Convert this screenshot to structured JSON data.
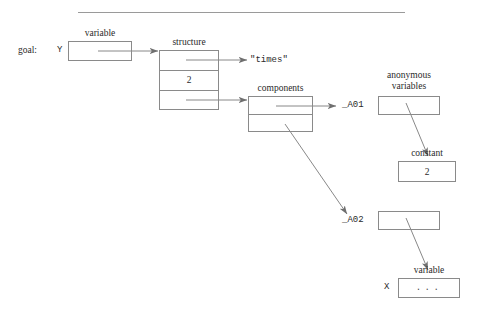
{
  "diagram": {
    "title_rule": "horizontal-rule",
    "goal_label": "goal:",
    "y_label": "Y",
    "x_label": "X",
    "captions": {
      "variable_y": "variable",
      "structure": "structure",
      "components": "components",
      "anonymous_variables_line1": "anonymous",
      "anonymous_variables_line2": "variables",
      "constant": "constant",
      "variable_x": "variable"
    },
    "values": {
      "functor": "\"times\"",
      "arity": "2",
      "constant_value": "2",
      "x_contents": "..."
    },
    "anon_refs": {
      "a01": "_A01",
      "a02": "_A02"
    },
    "colors": {
      "stroke": "#8a8a8a",
      "text": "#2a2a2a",
      "background": "#ffffff"
    }
  }
}
